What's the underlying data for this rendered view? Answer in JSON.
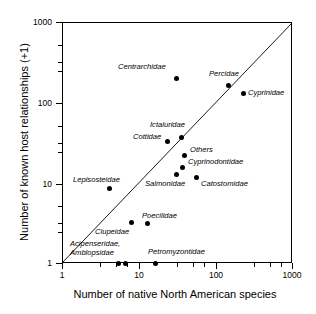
{
  "chart_data": {
    "type": "scatter",
    "title": "",
    "xlabel": "Number of native North American species",
    "ylabel": "Number of known host relationships (+1)",
    "xscale": "log",
    "yscale": "log",
    "xlim": [
      1,
      1000
    ],
    "ylim": [
      1,
      1000
    ],
    "xticks": [
      "1",
      "10",
      "100",
      "1000"
    ],
    "yticks": [
      "1",
      "10",
      "100",
      "1000"
    ],
    "grid": false,
    "legend": "none",
    "annotations": [
      "1:1 diagonal reference line drawn from (1,1) to (1000,1000)"
    ],
    "points": [
      {
        "label": "Centrarchidae",
        "x": 30,
        "y": 197,
        "px": 176,
        "py": 78,
        "lx": 118,
        "ly": 63,
        "multiline": false
      },
      {
        "label": "Percidae",
        "x": 150,
        "y": 160,
        "px": 228,
        "py": 85,
        "lx": 209,
        "ly": 70,
        "multiline": false
      },
      {
        "label": "Cyprinidae",
        "x": 230,
        "y": 130,
        "px": 243,
        "py": 93,
        "lx": 248,
        "ly": 89,
        "multiline": false
      },
      {
        "label": "Ictaluridae",
        "x": 35,
        "y": 36,
        "px": 181,
        "py": 137,
        "lx": 150,
        "ly": 121,
        "multiline": false
      },
      {
        "label": "Cottidae",
        "x": 27,
        "y": 30,
        "px": 167,
        "py": 141,
        "lx": 133,
        "ly": 133,
        "multiline": false
      },
      {
        "label": "Others",
        "x": 38,
        "y": 21,
        "px": 184,
        "py": 155,
        "lx": 190,
        "ly": 146,
        "multiline": false
      },
      {
        "label": "Cyprinodontidae",
        "x": 36,
        "y": 13,
        "px": 182,
        "py": 167,
        "lx": 188,
        "ly": 158,
        "multiline": false
      },
      {
        "label": "Salmonidae",
        "x": 31,
        "y": 11,
        "px": 176,
        "py": 174,
        "lx": 145,
        "ly": 180,
        "multiline": false
      },
      {
        "label": "Catostomidae",
        "x": 51,
        "y": 10,
        "px": 196,
        "py": 177,
        "lx": 201,
        "ly": 180,
        "multiline": false
      },
      {
        "label": "Lepisosteidae",
        "x": 4,
        "y": 8.5,
        "px": 109,
        "py": 188,
        "lx": 73,
        "ly": 176,
        "multiline": false
      },
      {
        "label": "Clupeidae",
        "x": 7.5,
        "y": 3,
        "px": 131,
        "py": 222,
        "lx": 95,
        "ly": 228,
        "multiline": false
      },
      {
        "label": "Poecilidae",
        "x": 13,
        "y": 3,
        "px": 147,
        "py": 223,
        "lx": 142,
        "ly": 212,
        "multiline": false
      },
      {
        "label": "Acipenseridae,\nAmblopsidae",
        "x": 6,
        "y": 1,
        "px": 118,
        "py": 263,
        "lx": 70,
        "ly": 240,
        "multiline": true
      },
      {
        "label": "",
        "x": 7,
        "y": 1,
        "px": 125,
        "py": 263,
        "lx": 0,
        "ly": 0,
        "multiline": false
      },
      {
        "label": "Petromyzontidae",
        "x": 16,
        "y": 1,
        "px": 155,
        "py": 263,
        "lx": 148,
        "ly": 248,
        "multiline": false
      }
    ]
  },
  "axes": {
    "y_ticks": [
      {
        "label": "1000",
        "py": 22
      },
      {
        "label": "100",
        "py": 103
      },
      {
        "label": "10",
        "py": 184
      },
      {
        "label": "1",
        "py": 263
      }
    ],
    "x_ticks": [
      {
        "label": "1",
        "px": 62
      },
      {
        "label": "10",
        "px": 139
      },
      {
        "label": "100",
        "px": 216
      },
      {
        "label": "1000",
        "px": 292
      }
    ],
    "x_minor": [
      100,
      116,
      127,
      177,
      193,
      204,
      254,
      270,
      281
    ],
    "y_minor": [
      45,
      62,
      71,
      126,
      143,
      152,
      206,
      223,
      232
    ]
  },
  "colors": {
    "axis": "#000000",
    "point": "#000000",
    "background": "#ffffff",
    "refline": "#000000"
  }
}
